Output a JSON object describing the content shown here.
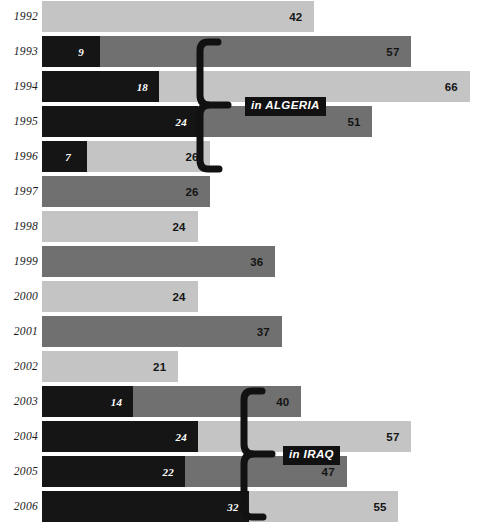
{
  "chart_data": {
    "type": "bar",
    "orientation": "horizontal",
    "title": "",
    "xlabel": "",
    "ylabel": "",
    "xlim": [
      0,
      67
    ],
    "grid": false,
    "legend_position": "none",
    "categories": [
      "1992",
      "1993",
      "1994",
      "1995",
      "1996",
      "1997",
      "1998",
      "1999",
      "2000",
      "2001",
      "2002",
      "2003",
      "2004",
      "2005",
      "2006"
    ],
    "series": [
      {
        "name": "total",
        "values": [
          42,
          57,
          66,
          51,
          26,
          26,
          24,
          36,
          24,
          37,
          21,
          40,
          57,
          47,
          55
        ]
      },
      {
        "name": "highlighted-segment",
        "values": [
          null,
          9,
          18,
          24,
          7,
          null,
          null,
          null,
          null,
          null,
          null,
          14,
          24,
          22,
          32
        ]
      }
    ],
    "annotations": [
      {
        "label": "in ALGERIA",
        "spans": [
          "1993",
          "1996"
        ]
      },
      {
        "label": "in IRAQ",
        "spans": [
          "2003",
          "2006"
        ]
      }
    ],
    "colors": {
      "light_gray": "#c4c4c4",
      "dark_gray": "#707070",
      "black": "#151515",
      "tag_background": "#111111",
      "tag_text": "#ffffff",
      "value_text": "#141414",
      "value_text_on_black": "#ffffff",
      "background": "#ffffff"
    }
  },
  "rows": [
    {
      "year": "1992",
      "total": "42",
      "dark": null,
      "shade": "light"
    },
    {
      "year": "1993",
      "total": "57",
      "dark": "9",
      "shade": "dark"
    },
    {
      "year": "1994",
      "total": "66",
      "dark": "18",
      "shade": "light"
    },
    {
      "year": "1995",
      "total": "51",
      "dark": "24",
      "shade": "dark"
    },
    {
      "year": "1996",
      "total": "26",
      "dark": "7",
      "shade": "light"
    },
    {
      "year": "1997",
      "total": "26",
      "dark": null,
      "shade": "dark"
    },
    {
      "year": "1998",
      "total": "24",
      "dark": null,
      "shade": "light"
    },
    {
      "year": "1999",
      "total": "36",
      "dark": null,
      "shade": "dark"
    },
    {
      "year": "2000",
      "total": "24",
      "dark": null,
      "shade": "light"
    },
    {
      "year": "2001",
      "total": "37",
      "dark": null,
      "shade": "dark"
    },
    {
      "year": "2002",
      "total": "21",
      "dark": null,
      "shade": "light"
    },
    {
      "year": "2003",
      "total": "40",
      "dark": "14",
      "shade": "dark"
    },
    {
      "year": "2004",
      "total": "57",
      "dark": "24",
      "shade": "light"
    },
    {
      "year": "2005",
      "total": "47",
      "dark": "22",
      "shade": "dark"
    },
    {
      "year": "2006",
      "total": "55",
      "dark": "32",
      "shade": "light"
    }
  ],
  "annotations": {
    "algeria": {
      "label": "in ALGERIA"
    },
    "iraq": {
      "label": "in IRAQ"
    }
  }
}
